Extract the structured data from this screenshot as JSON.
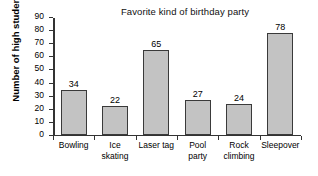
{
  "chart_data": {
    "type": "bar",
    "title": "Favorite kind of birthday party",
    "xlabel": "",
    "ylabel": "Number of high students",
    "categories": [
      "Bowling",
      "Ice skating",
      "Laser tag",
      "Pool party",
      "Rock climbing",
      "Sleepover"
    ],
    "category_lines": [
      [
        "Bowling"
      ],
      [
        "Ice",
        "skating"
      ],
      [
        "Laser tag"
      ],
      [
        "Pool",
        "party"
      ],
      [
        "Rock",
        "climbing"
      ],
      [
        "Sleepover"
      ]
    ],
    "values": [
      34,
      22,
      65,
      27,
      24,
      78
    ],
    "value_labels": [
      "34",
      "22",
      "65",
      "27",
      "24",
      "78"
    ],
    "ylim": [
      0,
      90
    ],
    "ytick_labels": [
      "0",
      "10",
      "20",
      "30",
      "40",
      "50",
      "60",
      "70",
      "80",
      "90"
    ],
    "ytick_values": [
      0,
      10,
      20,
      30,
      40,
      50,
      60,
      70,
      80,
      90
    ],
    "grid": false,
    "legend": false,
    "bar_color": "#c3c3c3",
    "bar_edge_color": "#3a3a3a",
    "axis_color": "#333333",
    "background": "#ffffff"
  }
}
